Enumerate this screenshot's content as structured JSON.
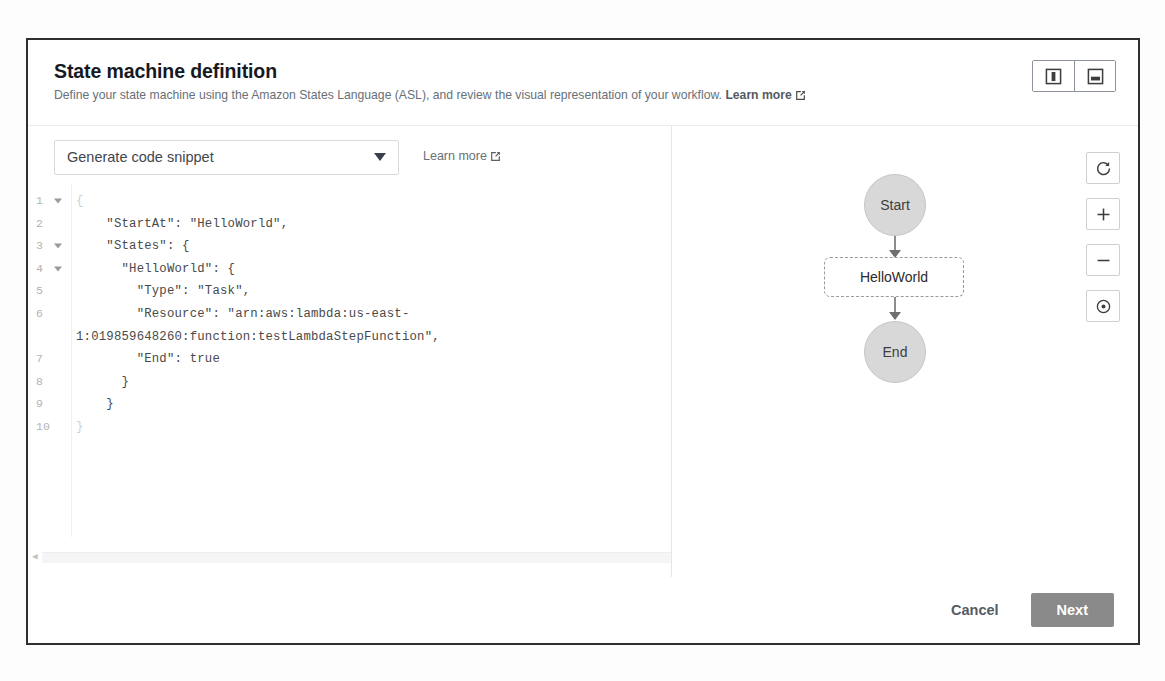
{
  "header": {
    "title": "State machine definition",
    "subtitle_text": "Define your state machine using the Amazon States Language (ASL), and review the visual representation of your workflow.",
    "learn_more": "Learn more",
    "layout_buttons": [
      {
        "name": "vertical-split-layout",
        "label": ""
      },
      {
        "name": "horizontal-split-layout",
        "label": ""
      }
    ]
  },
  "toolbar": {
    "snippet_select_value": "Generate code snippet",
    "snippet_select_options": [
      "Generate code snippet"
    ],
    "learn_more": "Learn more"
  },
  "editor": {
    "language": "json",
    "lines": [
      {
        "number": "1",
        "fold": true,
        "text": "{",
        "faint": true
      },
      {
        "number": "2",
        "fold": false,
        "text": "    \"StartAt\": \"HelloWorld\",",
        "faint": false
      },
      {
        "number": "3",
        "fold": true,
        "text": "    \"States\": {",
        "faint": false
      },
      {
        "number": "4",
        "fold": true,
        "text": "      \"HelloWorld\": {",
        "faint": false
      },
      {
        "number": "5",
        "fold": false,
        "text": "        \"Type\": \"Task\",",
        "faint": false
      },
      {
        "number": "6",
        "fold": false,
        "text": "        \"Resource\": \"arn:aws:lambda:us-east-",
        "faint": false
      },
      {
        "number": "",
        "fold": false,
        "text": "1:019859648260:function:testLambdaStepFunction\",",
        "faint": false
      },
      {
        "number": "7",
        "fold": false,
        "text": "        \"End\": true",
        "faint": false
      },
      {
        "number": "8",
        "fold": false,
        "text": "      }",
        "faint": false
      },
      {
        "number": "9",
        "fold": false,
        "text": "    }",
        "faint": false
      },
      {
        "number": "10",
        "fold": false,
        "text": "}",
        "faint": true
      }
    ]
  },
  "graph": {
    "nodes": [
      {
        "id": "start",
        "label": "Start",
        "shape": "circle"
      },
      {
        "id": "helloworld",
        "label": "HelloWorld",
        "shape": "rounded-rect-dashed"
      },
      {
        "id": "end",
        "label": "End",
        "shape": "circle"
      }
    ],
    "controls": [
      {
        "name": "refresh-graph-button",
        "icon": "refresh-icon"
      },
      {
        "name": "zoom-in-button",
        "icon": "plus-icon"
      },
      {
        "name": "zoom-out-button",
        "icon": "minus-icon"
      },
      {
        "name": "center-graph-button",
        "icon": "target-icon"
      }
    ]
  },
  "footer": {
    "cancel_label": "Cancel",
    "next_label": "Next"
  },
  "colors": {
    "node_fill": "#d8d8d8",
    "next_button": "#8a8a8a",
    "panel_border": "#2f2f2f",
    "muted_text": "#687078"
  }
}
